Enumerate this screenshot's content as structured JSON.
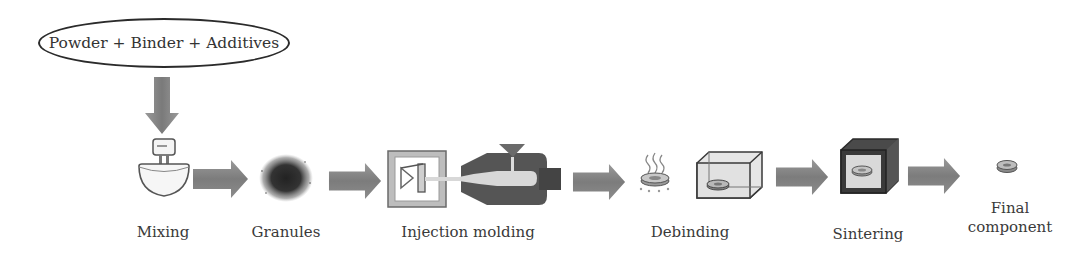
{
  "diagram": {
    "input": {
      "label": "Powder + Binder + Additives"
    },
    "steps": [
      {
        "label": "Mixing",
        "icon": "mixer-bowl-icon"
      },
      {
        "label": "Granules",
        "icon": "granules-icon"
      },
      {
        "label": "Injection molding",
        "icon": "injection-molding-machine-icon"
      },
      {
        "label": "Debinding",
        "icon": "debinding-furnace-icon"
      },
      {
        "label": "Sintering",
        "icon": "sintering-furnace-icon"
      },
      {
        "label_line1": "Final",
        "label_line2": "component",
        "icon": "final-part-icon"
      }
    ],
    "colors": {
      "arrow": "#8a8a8a",
      "arrow_dark": "#6e6e6e",
      "outline": "#2b2b2b",
      "text": "#3a3a3a"
    }
  }
}
